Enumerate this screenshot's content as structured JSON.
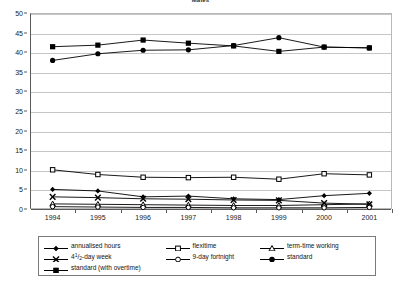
{
  "chart_data": {
    "type": "line",
    "title": "Males",
    "xlabel": "",
    "ylabel": "",
    "x": [
      1994,
      1995,
      1996,
      1997,
      1998,
      1999,
      2000,
      2001
    ],
    "categories": [
      "1994",
      "1995",
      "1996",
      "1997",
      "1998",
      "1999",
      "2000",
      "2001"
    ],
    "ylim": [
      0,
      50
    ],
    "ytick_labels": [
      "0",
      "5",
      "10",
      "15",
      "20",
      "25",
      "30",
      "35",
      "40",
      "45",
      "50"
    ],
    "ytick_values": [
      0,
      5,
      10,
      15,
      20,
      25,
      30,
      35,
      40,
      45,
      50
    ],
    "grid": true,
    "legend_position": "bottom",
    "series": [
      {
        "name": "annualised hours",
        "marker": "filled-diamond",
        "values": [
          5.0,
          4.6,
          3.1,
          3.3,
          2.6,
          2.4,
          3.4,
          4.0
        ]
      },
      {
        "name": "flexitime",
        "marker": "open-square",
        "values": [
          10.0,
          8.8,
          8.1,
          8.0,
          8.1,
          7.6,
          9.0,
          8.7
        ]
      },
      {
        "name": "term-time working",
        "marker": "open-triangle",
        "values": [
          1.3,
          1.2,
          1.1,
          1.0,
          0.9,
          0.9,
          1.1,
          1.3
        ]
      },
      {
        "name": "4½-day week",
        "marker": "cross-x",
        "values": [
          3.1,
          2.9,
          2.6,
          2.5,
          2.3,
          2.2,
          1.5,
          1.2
        ]
      },
      {
        "name": "9-day fortnight",
        "marker": "open-circle",
        "values": [
          0.6,
          0.5,
          0.4,
          0.4,
          0.3,
          0.3,
          0.3,
          0.4
        ]
      },
      {
        "name": "standard",
        "marker": "filled-circle",
        "values": [
          37.9,
          39.6,
          40.5,
          40.6,
          41.7,
          43.7,
          41.3,
          41.1
        ]
      },
      {
        "name": "standard (with overtime)",
        "marker": "filled-square",
        "values": [
          41.4,
          41.8,
          43.1,
          42.3,
          41.6,
          40.2,
          41.3,
          41.1
        ]
      }
    ]
  },
  "legend": {
    "entries": [
      {
        "label": "annualised hours",
        "marker": "filled-diamond"
      },
      {
        "label": "flexitime",
        "marker": "open-square"
      },
      {
        "label": "term-time working",
        "marker": "open-triangle"
      },
      {
        "label": "4½-day week",
        "marker": "cross-x"
      },
      {
        "label": "9-day fortnight",
        "marker": "open-circle"
      },
      {
        "label": "standard",
        "marker": "filled-circle"
      },
      {
        "label": "standard (with overtime)",
        "marker": "filled-square"
      }
    ]
  },
  "colors": {
    "series_line": "#000000",
    "gridline": "#c6c6c6",
    "axis": "#5a5a5a",
    "background": "#ffffff",
    "text": "#111111"
  }
}
